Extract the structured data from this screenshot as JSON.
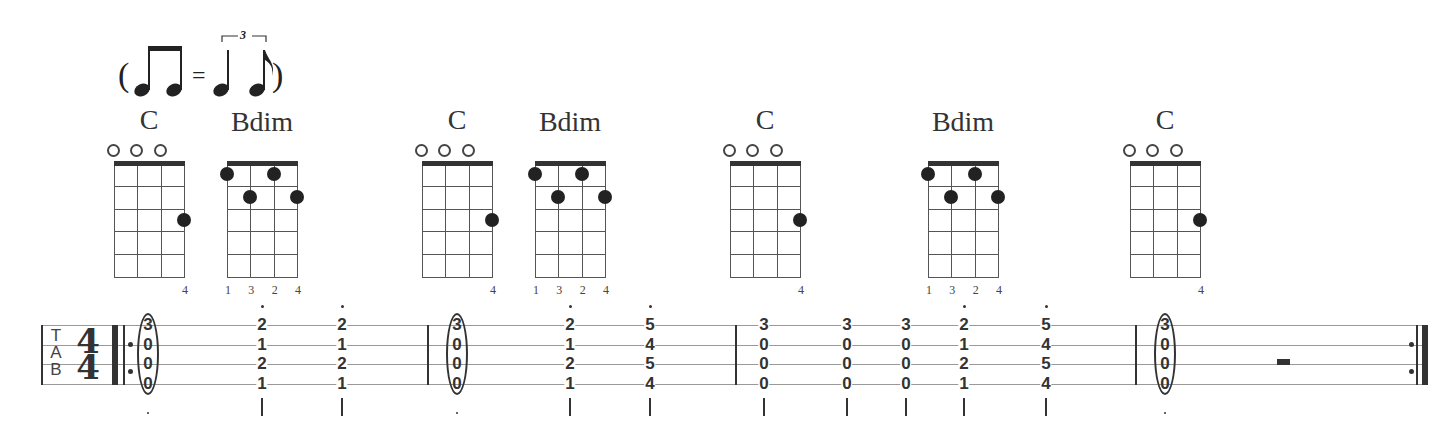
{
  "swing": {
    "open_paren": "(",
    "equals": "=",
    "triplet": "3",
    "close_paren": ")",
    "description": "two eighths equal triplet quarter + eighth"
  },
  "chords": [
    {
      "name": "C",
      "x": 114,
      "open": [
        1,
        2,
        3
      ],
      "dots": [
        {
          "string": 4,
          "fret": 3
        }
      ],
      "fingers": [
        "",
        "",
        "",
        "4"
      ]
    },
    {
      "name": "Bdim",
      "x": 227,
      "open": [],
      "dots": [
        {
          "string": 1,
          "fret": 1
        },
        {
          "string": 2,
          "fret": 2
        },
        {
          "string": 3,
          "fret": 1
        },
        {
          "string": 4,
          "fret": 2
        }
      ],
      "fingers": [
        "1",
        "3",
        "2",
        "4"
      ]
    },
    {
      "name": "C",
      "x": 422,
      "open": [
        1,
        2,
        3
      ],
      "dots": [
        {
          "string": 4,
          "fret": 3
        }
      ],
      "fingers": [
        "",
        "",
        "",
        "4"
      ]
    },
    {
      "name": "Bdim",
      "x": 535,
      "open": [],
      "dots": [
        {
          "string": 1,
          "fret": 1
        },
        {
          "string": 2,
          "fret": 2
        },
        {
          "string": 3,
          "fret": 1
        },
        {
          "string": 4,
          "fret": 2
        }
      ],
      "fingers": [
        "1",
        "3",
        "2",
        "4"
      ]
    },
    {
      "name": "C",
      "x": 730,
      "open": [
        1,
        2,
        3
      ],
      "dots": [
        {
          "string": 4,
          "fret": 3
        }
      ],
      "fingers": [
        "",
        "",
        "",
        "4"
      ]
    },
    {
      "name": "Bdim",
      "x": 928,
      "open": [],
      "dots": [
        {
          "string": 1,
          "fret": 1
        },
        {
          "string": 2,
          "fret": 2
        },
        {
          "string": 3,
          "fret": 1
        },
        {
          "string": 4,
          "fret": 2
        }
      ],
      "fingers": [
        "1",
        "3",
        "2",
        "4"
      ]
    },
    {
      "name": "C",
      "x": 1130,
      "open": [
        1,
        2,
        3
      ],
      "dots": [
        {
          "string": 4,
          "fret": 3
        }
      ],
      "fingers": [
        "",
        "",
        "",
        "4"
      ]
    }
  ],
  "tab": {
    "clef": [
      "T",
      "A",
      "B"
    ],
    "time_signature": {
      "top": "4",
      "bottom": "4"
    },
    "columns": [
      {
        "x": 148,
        "frets": [
          "3",
          "0",
          "0",
          "0"
        ],
        "arpeggio_oval": true,
        "stem": false,
        "staccato": false
      },
      {
        "x": 262,
        "frets": [
          "2",
          "1",
          "2",
          "1"
        ],
        "arpeggio_oval": false,
        "stem": true,
        "staccato": true
      },
      {
        "x": 342,
        "frets": [
          "2",
          "1",
          "2",
          "1"
        ],
        "arpeggio_oval": false,
        "stem": true,
        "staccato": true
      },
      {
        "x": 457,
        "frets": [
          "3",
          "0",
          "0",
          "0"
        ],
        "arpeggio_oval": true,
        "stem": false,
        "staccato": false
      },
      {
        "x": 570,
        "frets": [
          "2",
          "1",
          "2",
          "1"
        ],
        "arpeggio_oval": false,
        "stem": true,
        "staccato": true
      },
      {
        "x": 650,
        "frets": [
          "5",
          "4",
          "5",
          "4"
        ],
        "arpeggio_oval": false,
        "stem": true,
        "staccato": true
      },
      {
        "x": 764,
        "frets": [
          "3",
          "0",
          "0",
          "0"
        ],
        "arpeggio_oval": false,
        "stem": true,
        "staccato": false
      },
      {
        "x": 847,
        "frets": [
          "3",
          "0",
          "0",
          "0"
        ],
        "arpeggio_oval": false,
        "stem": true,
        "staccato": false
      },
      {
        "x": 906,
        "frets": [
          "3",
          "0",
          "0",
          "0"
        ],
        "arpeggio_oval": false,
        "stem": true,
        "staccato": false
      },
      {
        "x": 964,
        "frets": [
          "2",
          "1",
          "2",
          "1"
        ],
        "arpeggio_oval": false,
        "stem": true,
        "staccato": true
      },
      {
        "x": 1046,
        "frets": [
          "5",
          "4",
          "5",
          "4"
        ],
        "arpeggio_oval": false,
        "stem": true,
        "staccato": true
      },
      {
        "x": 1165,
        "frets": [
          "3",
          "0",
          "0",
          "0"
        ],
        "arpeggio_oval": true,
        "stem": false,
        "staccato": false
      }
    ],
    "barlines": [
      427,
      735,
      1135
    ],
    "rest": {
      "type": "half-rest",
      "x": 1283
    }
  }
}
